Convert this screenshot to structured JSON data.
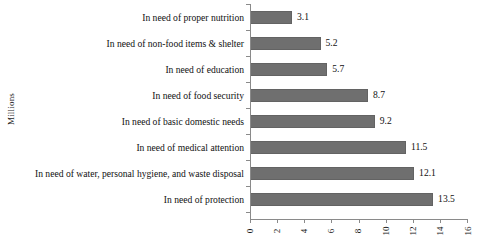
{
  "chart_data": {
    "type": "bar",
    "orientation": "horizontal",
    "title": "",
    "xlabel": "",
    "ylabel": "Millions",
    "xlim": [
      0,
      16
    ],
    "xticks": [
      "0",
      "2",
      "4",
      "6",
      "8",
      "10",
      "12",
      "14",
      "16"
    ],
    "grid": false,
    "legend": false,
    "bar_color": "#6f6f6f",
    "axis_color": "#8a8a8a",
    "text_color": "#111111",
    "categories": [
      "In need of proper nutrition",
      "In need of non-food items & shelter",
      "In need of education",
      "In need of food security",
      "In need of basic domestic needs",
      "In need of medical attention",
      "In need of water, personal hygiene, and waste disposal",
      "In need of protection"
    ],
    "values": [
      3.1,
      5.2,
      5.7,
      8.7,
      9.2,
      11.5,
      12.1,
      13.5
    ],
    "value_labels": [
      "3.1",
      "5.2",
      "5.7",
      "8.7",
      "9.2",
      "11.5",
      "12.1",
      "13.5"
    ]
  }
}
